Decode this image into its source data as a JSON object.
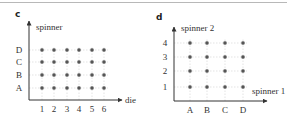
{
  "panels": [
    {
      "id": "c",
      "label": "c",
      "y_axis_label": "spinner",
      "x_axis_label": "die",
      "x_ticks": [
        "1",
        "2",
        "3",
        "4",
        "5",
        "6"
      ],
      "y_ticks": [
        "A",
        "B",
        "C",
        "D"
      ]
    },
    {
      "id": "d",
      "label": "d",
      "y_axis_label": "spinner 2",
      "x_axis_label": "spinner 1",
      "x_ticks": [
        "A",
        "B",
        "C",
        "D"
      ],
      "y_ticks": [
        "1",
        "2",
        "3",
        "4"
      ]
    }
  ],
  "colors": {
    "axis": "#333333",
    "dot": "#555555",
    "grid": "#d0d0d0",
    "top_rule": "#b8b8b8"
  }
}
